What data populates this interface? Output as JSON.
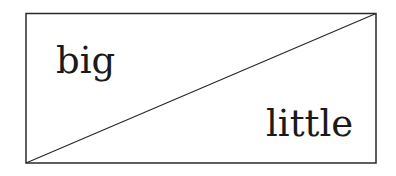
{
  "diagram": {
    "labels": {
      "upper_left": "big",
      "lower_right": "little"
    },
    "colors": {
      "stroke": "#2a2a2a",
      "text": "#1a1a1a",
      "background": "#ffffff"
    }
  }
}
